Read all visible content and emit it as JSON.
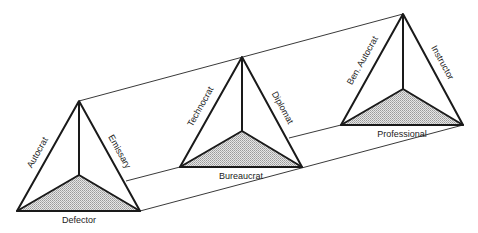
{
  "diagram": {
    "pyramids": [
      {
        "id": "left",
        "left_edge_label": "Autocrat",
        "right_edge_label": "Emissary",
        "base_label": "Defector",
        "apex": [
          79,
          101
        ],
        "base_left": [
          17,
          211
        ],
        "base_right": [
          140,
          211
        ],
        "inner": [
          79,
          175
        ]
      },
      {
        "id": "middle",
        "left_edge_label": "Technocrat",
        "right_edge_label": "Diplomat",
        "base_label": "Bureaucrat",
        "apex": [
          242,
          57
        ],
        "base_left": [
          180,
          167
        ],
        "base_right": [
          302,
          167
        ],
        "inner": [
          242,
          131
        ]
      },
      {
        "id": "right",
        "left_edge_label": "Ben. Autocrat",
        "right_edge_label": "Instructor",
        "base_label": "Professional",
        "apex": [
          403,
          14
        ],
        "base_left": [
          341,
          125
        ],
        "base_right": [
          463,
          125
        ],
        "inner": [
          403,
          89
        ]
      }
    ],
    "colors": {
      "line": "#1a1a1a",
      "shade": "#c8c8c8"
    }
  }
}
